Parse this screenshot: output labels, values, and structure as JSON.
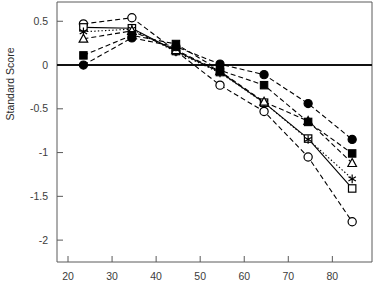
{
  "chart_data": {
    "type": "line",
    "title": "",
    "subtitle": "",
    "xlabel": "",
    "ylabel": "Standard Score",
    "xlim": [
      17.5,
      89
    ],
    "ylim": [
      -2.25,
      0.72
    ],
    "grid": false,
    "legend_position": "none",
    "x": [
      23.5,
      34.5,
      44.5,
      54.5,
      64.5,
      74.5,
      84.5
    ],
    "xticks": [
      20,
      30,
      40,
      50,
      60,
      70,
      80
    ],
    "xtick_labels": [
      "20",
      "30",
      "40",
      "50",
      "60",
      "70",
      "80"
    ],
    "yticks": [
      0.5,
      0,
      -0.5,
      -1,
      -1.5,
      -2
    ],
    "ytick_labels": [
      "0.5",
      "0",
      "-0.5",
      "-1",
      "-1.5",
      "-2"
    ],
    "reference_line": 0,
    "series": [
      {
        "name": "open-circle",
        "marker": "open-circle",
        "linestyle": "dashed",
        "values": [
          0.47,
          0.54,
          0.16,
          -0.23,
          -0.53,
          -1.05,
          -1.79
        ]
      },
      {
        "name": "open-square",
        "marker": "open-square",
        "linestyle": "solid",
        "values": [
          0.43,
          0.42,
          0.16,
          -0.08,
          -0.43,
          -0.84,
          -1.41
        ]
      },
      {
        "name": "star",
        "marker": "star",
        "linestyle": "dotted",
        "values": [
          0.38,
          0.41,
          0.15,
          -0.09,
          -0.43,
          -0.85,
          -1.3
        ]
      },
      {
        "name": "open-triangle",
        "marker": "open-triangle",
        "linestyle": "dashed",
        "values": [
          0.3,
          0.39,
          0.17,
          -0.07,
          -0.42,
          -0.64,
          -1.12
        ]
      },
      {
        "name": "filled-square",
        "marker": "filled-square",
        "linestyle": "dashed",
        "values": [
          0.11,
          0.34,
          0.24,
          -0.06,
          -0.23,
          -0.65,
          -1.01
        ]
      },
      {
        "name": "filled-circle",
        "marker": "filled-circle",
        "linestyle": "dashed",
        "values": [
          0.0,
          0.31,
          0.21,
          0.01,
          -0.11,
          -0.44,
          -0.85
        ]
      }
    ]
  },
  "axes": {
    "y_axis_title": "Standard Score"
  }
}
